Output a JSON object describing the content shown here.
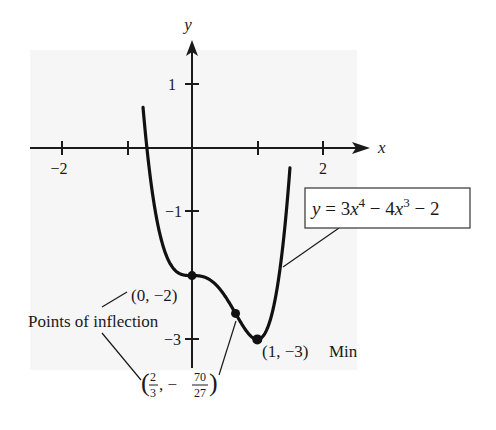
{
  "chart_data": {
    "type": "line",
    "title": "",
    "equation_label": "y = 3x⁴ − 4x³ − 2",
    "equation": {
      "prefix": "y = 3",
      "x1": "x",
      "exp1": "4",
      "mid": " − 4",
      "x2": "x",
      "exp2": "3",
      "suffix": " − 2"
    },
    "xlabel": "x",
    "ylabel": "y",
    "xlim": [
      -2.5,
      2.3
    ],
    "ylim": [
      -3.7,
      1.6
    ],
    "grid": false,
    "x_ticks": [
      -2,
      -1,
      2
    ],
    "x_tick_labels": [
      "−2",
      "",
      "2"
    ],
    "y_ticks": [
      1,
      -1,
      -3
    ],
    "y_tick_labels": [
      "1",
      "−1",
      "−3"
    ],
    "series": [
      {
        "name": "y = 3x^4 - 4x^3 - 2",
        "x": [
          -0.7,
          -0.6,
          -0.5,
          -0.4,
          -0.3,
          -0.2,
          -0.1,
          0,
          0.1,
          0.2,
          0.3,
          0.4,
          0.5,
          0.6,
          0.667,
          0.7,
          0.8,
          0.9,
          1.0,
          1.1,
          1.2,
          1.3,
          1.4,
          1.45
        ],
        "values": [
          0.092,
          -0.746,
          -1.313,
          -1.667,
          -1.868,
          -1.963,
          -1.996,
          -2.0,
          -2.0037,
          -2.0272,
          -2.0837,
          -2.1792,
          -2.3125,
          -2.4752,
          -2.5926,
          -2.6517,
          -2.8192,
          -2.9477,
          -3.0,
          -2.9317,
          -2.6912,
          -2.2087,
          -1.4512,
          -0.9585
        ]
      }
    ],
    "points": [
      {
        "x": 0,
        "y": -2,
        "label": "(0, −2)",
        "kind": "Point of inflection"
      },
      {
        "x": 0.6667,
        "y": -2.5926,
        "label": "(2/3, −70/27)",
        "kind": "Point of inflection"
      },
      {
        "x": 1,
        "y": -3,
        "label": "(1, −3) Min",
        "kind": "Minimum"
      }
    ],
    "annotations": [
      "(0, −2)",
      "Points of inflection",
      "(2/3, −70/27)",
      "(1, −3) Min",
      "y = 3x⁴ − 4x³ − 2"
    ]
  },
  "labels": {
    "x_axis": "x",
    "y_axis": "y",
    "tick_x_neg2": "−2",
    "tick_x_2": "2",
    "tick_y_1": "1",
    "tick_y_neg1": "−1",
    "tick_y_neg3": "−3",
    "pt_origin": "(0, −2)",
    "inflection_caption": "Points of inflection",
    "pt_min": "(1, −3)",
    "min_word": "Min",
    "frac1_num": "2",
    "frac1_den": "3",
    "frac2_num": "70",
    "frac2_den": "27",
    "frac_sep": ", −",
    "paren_open": "(",
    "paren_close": ")"
  },
  "colors": {
    "plot_background": "#f6f6f6",
    "curve": "#111111",
    "axis": "#1a1a1a",
    "text": "#1a1a1a"
  }
}
